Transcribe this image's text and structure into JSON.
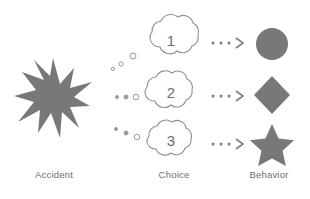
{
  "diagram": {
    "title_visible": false,
    "columns": [
      {
        "id": "accident",
        "label": "Accident"
      },
      {
        "id": "choice",
        "label": "Choice"
      },
      {
        "id": "behavior",
        "label": "Behavior"
      }
    ],
    "accident": {
      "icon": "starburst-explosion-icon",
      "fill": "#787878"
    },
    "choices": [
      {
        "id": "choice-1",
        "number": "1",
        "icon": "thought-cloud-icon"
      },
      {
        "id": "choice-2",
        "number": "2",
        "icon": "thought-cloud-icon"
      },
      {
        "id": "choice-3",
        "number": "3",
        "icon": "thought-cloud-icon"
      }
    ],
    "connectors": {
      "thought_trail_icon": "thought-bubble-trail-icon",
      "arrow_icon": "dotted-arrow-icon",
      "count": 3
    },
    "behaviors": [
      {
        "id": "behavior-1",
        "icon": "filled-circle-icon",
        "fill": "#787878"
      },
      {
        "id": "behavior-2",
        "icon": "filled-diamond-icon",
        "fill": "#787878"
      },
      {
        "id": "behavior-3",
        "icon": "filled-star-icon",
        "fill": "#787878"
      }
    ],
    "colors": {
      "shape_fill": "#787878",
      "outline": "#8a8a8a",
      "text": "#6d6d6d",
      "background": "#ffffff"
    }
  }
}
